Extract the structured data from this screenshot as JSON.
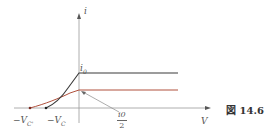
{
  "figure": {
    "caption": "図 14.6",
    "axes": {
      "y_label": "i",
      "x_label": "V"
    },
    "labels": {
      "i0": "i",
      "i0_sub": "0",
      "half_num": "i0",
      "half_den": "2",
      "neg_vc_prime": "−V",
      "neg_vc_prime_sub": "C'",
      "neg_vc": "−V",
      "neg_vc_sub": "C"
    },
    "colors": {
      "axis": "#9a9a9a",
      "curve_full": "#3a3a3a",
      "curve_half": "#b0503c",
      "pointer": "#8a8a8a"
    },
    "curves": [
      {
        "name": "i0 saturation curve",
        "start_x": "-V_C",
        "plateau": "i0"
      },
      {
        "name": "i0/2 saturation curve",
        "start_x": "-V_C'",
        "plateau": "i0/2"
      }
    ]
  }
}
